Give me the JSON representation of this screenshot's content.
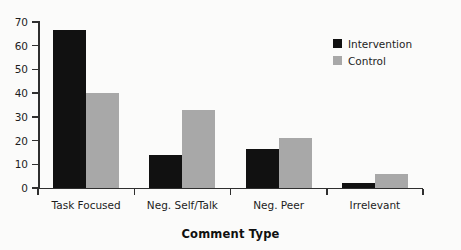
{
  "chart_data": {
    "type": "bar",
    "title": "",
    "xlabel": "Comment Type",
    "ylabel": "",
    "categories": [
      "Task Focused",
      "Neg. Self/Talk",
      "Neg. Peer",
      "Irrelevant"
    ],
    "series": [
      {
        "name": "Intervention",
        "color": "#111111",
        "values": [
          66.5,
          14,
          16.5,
          2
        ]
      },
      {
        "name": "Control",
        "color": "#a8a8a8",
        "values": [
          40,
          33,
          21,
          6
        ]
      }
    ],
    "ylim": [
      0,
      70
    ],
    "yticks": [
      0,
      10,
      20,
      30,
      40,
      50,
      60,
      70
    ],
    "ytick_labels": [
      "0",
      "10",
      "20",
      "30",
      "40",
      "50",
      "60",
      "70"
    ],
    "grid": false,
    "legend_position": "top-right",
    "background_color": "#fbfbfa",
    "axis_color": "#2f2f2f"
  },
  "legend": {
    "entries": [
      {
        "label": "Intervention"
      },
      {
        "label": "Control"
      }
    ]
  }
}
